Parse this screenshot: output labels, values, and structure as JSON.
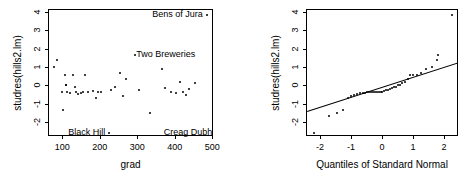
{
  "figure": {
    "kind": "regression-diagnostic-plots",
    "panels": 2,
    "background": "#ffffff",
    "foreground": "#000000"
  },
  "chart_data": [
    {
      "type": "scatter",
      "title": "",
      "xlabel": "grad",
      "ylabel": "studres(hills2.lm)",
      "xlim": [
        62,
        502
      ],
      "ylim": [
        -2.75,
        4.15
      ],
      "xticks": [
        100,
        200,
        300,
        400,
        500
      ],
      "yticks": [
        -2,
        -1,
        0,
        1,
        2,
        3,
        4
      ],
      "grid": false,
      "legend": null,
      "points": [
        {
          "x": 76,
          "y": 1.08
        },
        {
          "x": 84,
          "y": 1.46
        },
        {
          "x": 97,
          "y": -0.32
        },
        {
          "x": 100,
          "y": -1.28
        },
        {
          "x": 104,
          "y": 0.62
        },
        {
          "x": 106,
          "y": 0.1
        },
        {
          "x": 107,
          "y": 0.05
        },
        {
          "x": 110,
          "y": -0.28
        },
        {
          "x": 117,
          "y": -0.35
        },
        {
          "x": 127,
          "y": 0.6
        },
        {
          "x": 130,
          "y": -0.02
        },
        {
          "x": 133,
          "y": -0.3
        },
        {
          "x": 139,
          "y": -0.44
        },
        {
          "x": 148,
          "y": -0.35
        },
        {
          "x": 152,
          "y": -0.28
        },
        {
          "x": 158,
          "y": 0.63
        },
        {
          "x": 166,
          "y": -0.3
        },
        {
          "x": 178,
          "y": -0.25
        },
        {
          "x": 186,
          "y": -0.62
        },
        {
          "x": 192,
          "y": -0.28
        },
        {
          "x": 200,
          "y": -0.3
        },
        {
          "x": 222,
          "y": -2.52
        },
        {
          "x": 228,
          "y": -0.18
        },
        {
          "x": 238,
          "y": -0.02
        },
        {
          "x": 250,
          "y": 0.74
        },
        {
          "x": 258,
          "y": -0.52
        },
        {
          "x": 268,
          "y": 0.42
        },
        {
          "x": 290,
          "y": 1.72
        },
        {
          "x": 303,
          "y": -0.17
        },
        {
          "x": 332,
          "y": -1.42
        },
        {
          "x": 362,
          "y": 0.95
        },
        {
          "x": 372,
          "y": -0.08
        },
        {
          "x": 388,
          "y": -0.3
        },
        {
          "x": 400,
          "y": -0.35
        },
        {
          "x": 412,
          "y": 0.25
        },
        {
          "x": 418,
          "y": -0.32
        },
        {
          "x": 428,
          "y": -0.48
        },
        {
          "x": 436,
          "y": -0.12
        },
        {
          "x": 450,
          "y": 0.18
        },
        {
          "x": 482,
          "y": 3.88
        }
      ],
      "annotations": [
        {
          "text": "Bens of Jura",
          "x": 475,
          "y": 3.88,
          "align": "right"
        },
        {
          "text": "Two Breweries",
          "x": 297,
          "y": 1.72,
          "align": "left"
        },
        {
          "text": "Black Hill",
          "x": 215,
          "y": -2.52,
          "align": "right"
        },
        {
          "text": "Creag Dubh",
          "x": 500,
          "y": -2.52,
          "align": "right"
        }
      ]
    },
    {
      "type": "scatter",
      "title": "",
      "xlabel": "Quantiles of Standard Normal",
      "ylabel": "studres(hills2.lm)",
      "xlim": [
        -2.45,
        2.45
      ],
      "ylim": [
        -2.75,
        4.15
      ],
      "xticks": [
        -2,
        -1,
        0,
        1,
        2
      ],
      "yticks": [
        -2,
        -1,
        0,
        1,
        2,
        3,
        4
      ],
      "grid": false,
      "legend": null,
      "reference_line": {
        "kind": "qqline",
        "x1": -2.45,
        "y1": -1.34,
        "x2": 2.45,
        "y2": 1.32
      },
      "points": [
        {
          "x": -2.23,
          "y": -2.52
        },
        {
          "x": -1.73,
          "y": -1.62
        },
        {
          "x": -1.47,
          "y": -1.42
        },
        {
          "x": -1.28,
          "y": -1.28
        },
        {
          "x": -1.14,
          "y": -0.62
        },
        {
          "x": -1.02,
          "y": -0.52
        },
        {
          "x": -0.92,
          "y": -0.48
        },
        {
          "x": -0.83,
          "y": -0.44
        },
        {
          "x": -0.74,
          "y": -0.35
        },
        {
          "x": -0.66,
          "y": -0.35
        },
        {
          "x": -0.59,
          "y": -0.35
        },
        {
          "x": -0.52,
          "y": -0.32
        },
        {
          "x": -0.45,
          "y": -0.32
        },
        {
          "x": -0.38,
          "y": -0.3
        },
        {
          "x": -0.32,
          "y": -0.3
        },
        {
          "x": -0.26,
          "y": -0.3
        },
        {
          "x": -0.2,
          "y": -0.3
        },
        {
          "x": -0.14,
          "y": -0.28
        },
        {
          "x": -0.08,
          "y": -0.28
        },
        {
          "x": -0.02,
          "y": -0.28
        },
        {
          "x": 0.04,
          "y": -0.25
        },
        {
          "x": 0.1,
          "y": -0.18
        },
        {
          "x": 0.16,
          "y": -0.17
        },
        {
          "x": 0.22,
          "y": -0.12
        },
        {
          "x": 0.28,
          "y": -0.08
        },
        {
          "x": 0.34,
          "y": -0.02
        },
        {
          "x": 0.41,
          "y": -0.02
        },
        {
          "x": 0.48,
          "y": 0.05
        },
        {
          "x": 0.55,
          "y": 0.1
        },
        {
          "x": 0.62,
          "y": 0.18
        },
        {
          "x": 0.7,
          "y": 0.25
        },
        {
          "x": 0.79,
          "y": 0.42
        },
        {
          "x": 0.88,
          "y": 0.6
        },
        {
          "x": 0.98,
          "y": 0.62
        },
        {
          "x": 1.09,
          "y": 0.63
        },
        {
          "x": 1.22,
          "y": 0.74
        },
        {
          "x": 1.38,
          "y": 0.95
        },
        {
          "x": 1.58,
          "y": 1.08
        },
        {
          "x": 1.73,
          "y": 1.46
        },
        {
          "x": 1.76,
          "y": 1.72
        },
        {
          "x": 2.23,
          "y": 3.88
        }
      ],
      "annotations": []
    }
  ]
}
